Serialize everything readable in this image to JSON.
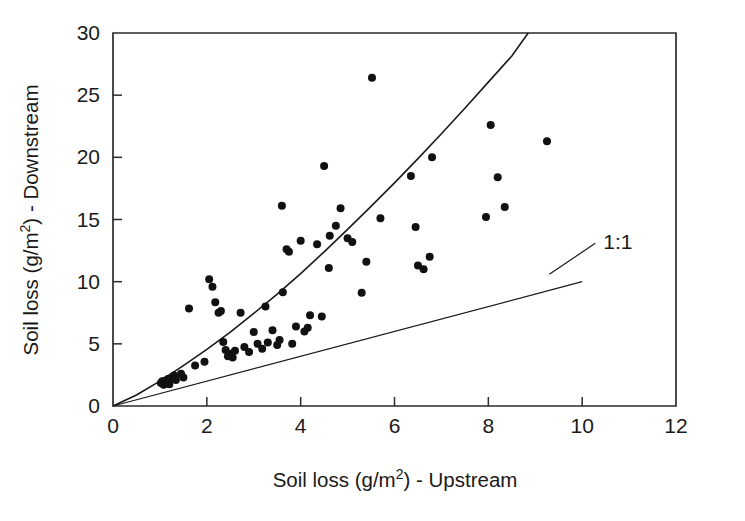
{
  "chart_data": {
    "type": "scatter",
    "title": "",
    "xlabel": "Soil loss (g/m2) - Upstream",
    "xlabel_parts": {
      "pre": "Soil loss (g/m",
      "sup": "2",
      "post": ") - Upstream"
    },
    "ylabel": "Soil loss (g/m2) - Downstream",
    "ylabel_parts": {
      "pre": "Soil loss (g/m",
      "sup": "2",
      "post": ") - Downstream"
    },
    "xlim": [
      0,
      12
    ],
    "ylim": [
      0,
      30
    ],
    "xticks": [
      0,
      2,
      4,
      6,
      8,
      10,
      12
    ],
    "yticks": [
      0,
      5,
      10,
      15,
      20,
      25,
      30
    ],
    "xtick_labels": [
      "0",
      "2",
      "4",
      "6",
      "8",
      "10",
      "12"
    ],
    "ytick_labels": [
      "0",
      "5",
      "10",
      "15",
      "20",
      "25",
      "30"
    ],
    "grid": false,
    "legend": "none",
    "marker": "filled-circle",
    "marker_color": "#111111",
    "annotations": [
      {
        "text": "1:1",
        "x": 10.45,
        "y": 12.6,
        "leader_from_x": 9.3,
        "leader_from_y": 10.6
      }
    ],
    "series": [
      {
        "name": "Paired soil loss observations",
        "type": "scatter",
        "points": [
          [
            1.02,
            1.85
          ],
          [
            1.05,
            2.0
          ],
          [
            1.08,
            1.7
          ],
          [
            1.12,
            2.05
          ],
          [
            1.15,
            1.9
          ],
          [
            1.18,
            2.2
          ],
          [
            1.2,
            1.75
          ],
          [
            1.3,
            2.45
          ],
          [
            1.34,
            2.1
          ],
          [
            1.45,
            2.6
          ],
          [
            1.5,
            2.3
          ],
          [
            1.62,
            7.85
          ],
          [
            1.75,
            3.25
          ],
          [
            1.95,
            3.55
          ],
          [
            2.05,
            10.2
          ],
          [
            2.12,
            9.6
          ],
          [
            2.18,
            8.35
          ],
          [
            2.25,
            7.5
          ],
          [
            2.3,
            7.65
          ],
          [
            2.35,
            5.15
          ],
          [
            2.4,
            4.5
          ],
          [
            2.45,
            4.0
          ],
          [
            2.5,
            4.2
          ],
          [
            2.55,
            3.9
          ],
          [
            2.6,
            4.45
          ],
          [
            2.72,
            7.5
          ],
          [
            2.8,
            4.75
          ],
          [
            2.9,
            4.35
          ],
          [
            3.0,
            5.95
          ],
          [
            3.08,
            5.0
          ],
          [
            3.18,
            4.6
          ],
          [
            3.25,
            8.0
          ],
          [
            3.3,
            5.1
          ],
          [
            3.4,
            6.1
          ],
          [
            3.5,
            4.9
          ],
          [
            3.55,
            5.3
          ],
          [
            3.6,
            16.1
          ],
          [
            3.62,
            9.15
          ],
          [
            3.7,
            12.6
          ],
          [
            3.75,
            12.4
          ],
          [
            3.82,
            5.0
          ],
          [
            3.9,
            6.4
          ],
          [
            4.0,
            13.3
          ],
          [
            4.08,
            6.0
          ],
          [
            4.15,
            6.3
          ],
          [
            4.2,
            7.3
          ],
          [
            4.35,
            13.0
          ],
          [
            4.45,
            7.2
          ],
          [
            4.5,
            19.3
          ],
          [
            4.6,
            11.1
          ],
          [
            4.62,
            13.7
          ],
          [
            4.75,
            14.5
          ],
          [
            4.85,
            15.9
          ],
          [
            5.0,
            13.5
          ],
          [
            5.1,
            13.2
          ],
          [
            5.3,
            9.1
          ],
          [
            5.4,
            11.6
          ],
          [
            5.52,
            26.4
          ],
          [
            5.7,
            15.1
          ],
          [
            6.35,
            18.5
          ],
          [
            6.45,
            14.4
          ],
          [
            6.5,
            11.3
          ],
          [
            6.62,
            11.0
          ],
          [
            6.75,
            12.0
          ],
          [
            6.8,
            20.0
          ],
          [
            7.95,
            15.2
          ],
          [
            8.05,
            22.6
          ],
          [
            8.2,
            18.4
          ],
          [
            8.35,
            16.0
          ],
          [
            9.25,
            21.3
          ]
        ]
      },
      {
        "name": "Fitted power curve",
        "type": "line",
        "equation_hint": "y = 2.12 * x^1.17",
        "points": [
          [
            0.0,
            0.0
          ],
          [
            0.5,
            0.89
          ],
          [
            1.0,
            2.0
          ],
          [
            1.5,
            3.25
          ],
          [
            2.0,
            4.55
          ],
          [
            2.5,
            5.95
          ],
          [
            3.0,
            7.45
          ],
          [
            3.5,
            9.0
          ],
          [
            4.0,
            10.65
          ],
          [
            4.5,
            12.4
          ],
          [
            5.0,
            14.2
          ],
          [
            5.5,
            16.05
          ],
          [
            6.0,
            17.95
          ],
          [
            6.5,
            19.9
          ],
          [
            7.0,
            21.9
          ],
          [
            7.5,
            23.95
          ],
          [
            8.0,
            26.05
          ],
          [
            8.5,
            28.15
          ],
          [
            8.85,
            30.0
          ]
        ]
      },
      {
        "name": "1:1 reference line",
        "type": "line",
        "points": [
          [
            0.0,
            0.0
          ],
          [
            10.0,
            10.0
          ]
        ]
      }
    ]
  }
}
